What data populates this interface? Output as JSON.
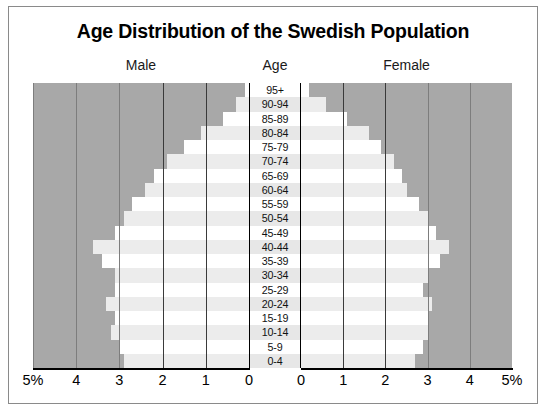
{
  "chart_data": {
    "type": "bar",
    "subtype": "population-pyramid",
    "title": "Age Distribution of the Swedish Population",
    "xlabel": "",
    "ylabel": "Age",
    "xlim": [
      0,
      5
    ],
    "unit": "%",
    "grid": true,
    "legend_position": "top",
    "headers": {
      "left": "Male",
      "center": "Age",
      "right": "Female"
    },
    "categories": [
      "95+",
      "90-94",
      "85-89",
      "80-84",
      "75-79",
      "70-74",
      "65-69",
      "60-64",
      "55-59",
      "50-54",
      "45-49",
      "40-44",
      "35-39",
      "30-34",
      "25-29",
      "20-24",
      "15-19",
      "10-14",
      "5-9",
      "0-4"
    ],
    "series": [
      {
        "name": "Male",
        "side": "left",
        "values": [
          0.1,
          0.3,
          0.6,
          1.1,
          1.5,
          1.9,
          2.2,
          2.4,
          2.7,
          2.9,
          3.1,
          3.6,
          3.4,
          3.1,
          3.1,
          3.3,
          3.1,
          3.2,
          3.0,
          2.9
        ]
      },
      {
        "name": "Female",
        "side": "right",
        "values": [
          0.2,
          0.6,
          1.1,
          1.6,
          1.9,
          2.2,
          2.4,
          2.5,
          2.8,
          3.0,
          3.2,
          3.5,
          3.3,
          3.0,
          2.9,
          3.1,
          3.0,
          3.0,
          2.9,
          2.7
        ]
      }
    ],
    "xticks_left": [
      "5%",
      "4",
      "3",
      "2",
      "1",
      "0"
    ],
    "xticks_right": [
      "0",
      "1",
      "2",
      "3",
      "4",
      "5%"
    ],
    "colors": {
      "panel_background": "#a8a8a8",
      "bar_primary": "#ffffff",
      "bar_alternate": "#ececec",
      "gridline": "#7d7d7d",
      "axis": "#000000",
      "title": "#000000",
      "frame": "#8a8a8a"
    }
  }
}
